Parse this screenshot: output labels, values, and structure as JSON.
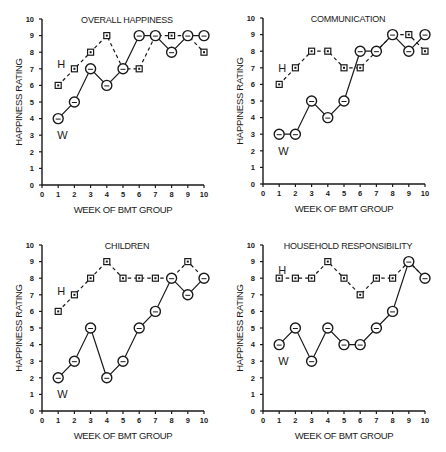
{
  "figure": {
    "panels_layout": "2x2"
  },
  "chart_data": [
    {
      "type": "line",
      "title": "OVERALL HAPPINESS",
      "xlabel": "WEEK OF BMT GROUP",
      "ylabel": "HAPPINESS RATING",
      "x": [
        1,
        2,
        3,
        4,
        5,
        6,
        7,
        8,
        9,
        10
      ],
      "xlim": [
        0,
        10
      ],
      "ylim": [
        0,
        10
      ],
      "xticks": [
        "0",
        "1",
        "2",
        "3",
        "4",
        "5",
        "6",
        "7",
        "8",
        "9",
        "10"
      ],
      "yticks": [
        "0",
        "1",
        "2",
        "3",
        "4",
        "5",
        "6",
        "7",
        "8",
        "9",
        "10"
      ],
      "grid": false,
      "series": [
        {
          "name": "H",
          "style": "dashed-square",
          "values": [
            6,
            7,
            8,
            9,
            7,
            7,
            9,
            9,
            9,
            8
          ]
        },
        {
          "name": "W",
          "style": "solid-circle",
          "values": [
            4,
            5,
            7,
            6,
            7,
            9,
            9,
            8,
            9,
            9
          ]
        }
      ],
      "labels": {
        "H": {
          "x": 1,
          "y": 7.3
        },
        "W": {
          "x": 1,
          "y": 3.0
        }
      }
    },
    {
      "type": "line",
      "title": "COMMUNICATION",
      "xlabel": "WEEK OF BMT GROUP",
      "ylabel": "HAPPINESS RATING",
      "x": [
        1,
        2,
        3,
        4,
        5,
        6,
        7,
        8,
        9,
        10
      ],
      "xlim": [
        0,
        10
      ],
      "ylim": [
        0,
        10
      ],
      "xticks": [
        "0",
        "1",
        "2",
        "3",
        "4",
        "5",
        "6",
        "7",
        "8",
        "9",
        "10"
      ],
      "yticks": [
        "0",
        "1",
        "2",
        "3",
        "4",
        "5",
        "6",
        "7",
        "8",
        "9",
        "10"
      ],
      "grid": false,
      "series": [
        {
          "name": "H",
          "style": "dashed-square",
          "values": [
            6,
            7,
            8,
            8,
            7,
            7,
            8,
            9,
            9,
            8
          ]
        },
        {
          "name": "W",
          "style": "solid-circle",
          "values": [
            3,
            3,
            5,
            4,
            5,
            8,
            8,
            9,
            8,
            9
          ]
        }
      ],
      "labels": {
        "H": {
          "x": 1,
          "y": 7.0
        },
        "W": {
          "x": 1,
          "y": 2.0
        }
      }
    },
    {
      "type": "line",
      "title": "CHILDREN",
      "xlabel": "WEEK OF BMT GROUP",
      "ylabel": "HAPPINESS RATING",
      "x": [
        1,
        2,
        3,
        4,
        5,
        6,
        7,
        8,
        9,
        10
      ],
      "xlim": [
        0,
        10
      ],
      "ylim": [
        0,
        10
      ],
      "xticks": [
        "0",
        "1",
        "2",
        "3",
        "4",
        "5",
        "6",
        "7",
        "8",
        "9",
        "10"
      ],
      "yticks": [
        "0",
        "1",
        "2",
        "3",
        "4",
        "5",
        "6",
        "7",
        "8",
        "9",
        "10"
      ],
      "grid": false,
      "series": [
        {
          "name": "H",
          "style": "dashed-square",
          "values": [
            6,
            7,
            8,
            9,
            8,
            8,
            8,
            8,
            9,
            8
          ]
        },
        {
          "name": "W",
          "style": "solid-circle",
          "values": [
            2,
            3,
            5,
            2,
            3,
            5,
            6,
            8,
            7,
            8
          ]
        }
      ],
      "labels": {
        "H": {
          "x": 1,
          "y": 7.2
        },
        "W": {
          "x": 1,
          "y": 1.0
        }
      }
    },
    {
      "type": "line",
      "title": "HOUSEHOLD RESPONSIBILITY",
      "xlabel": "WEEK OF BMT GROUP",
      "ylabel": "HAPPINESS RATING",
      "x": [
        1,
        2,
        3,
        4,
        5,
        6,
        7,
        8,
        9,
        10
      ],
      "xlim": [
        0,
        10
      ],
      "ylim": [
        0,
        10
      ],
      "xticks": [
        "0",
        "1",
        "2",
        "3",
        "4",
        "5",
        "6",
        "7",
        "8",
        "9",
        "10"
      ],
      "yticks": [
        "0",
        "1",
        "2",
        "3",
        "4",
        "5",
        "6",
        "7",
        "8",
        "9",
        "10"
      ],
      "grid": false,
      "series": [
        {
          "name": "H",
          "style": "dashed-square",
          "values": [
            8,
            8,
            8,
            9,
            8,
            7,
            8,
            8,
            9,
            8
          ]
        },
        {
          "name": "W",
          "style": "solid-circle",
          "values": [
            4,
            5,
            3,
            5,
            4,
            4,
            5,
            6,
            9,
            8
          ]
        }
      ],
      "labels": {
        "H": {
          "x": 1,
          "y": 8.5
        },
        "W": {
          "x": 1,
          "y": 3.0
        }
      }
    }
  ]
}
